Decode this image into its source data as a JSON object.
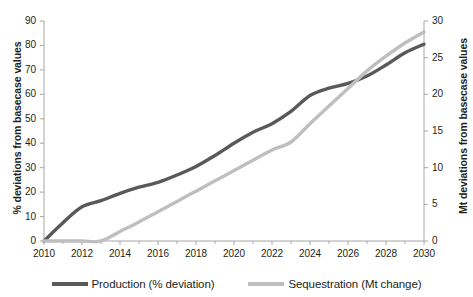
{
  "chart_data": {
    "type": "line",
    "title": "",
    "xlabel": "",
    "ylabel": "% deviations from basecase values",
    "ylabel_right": "Mt deviations from basecase values",
    "xlim": [
      2010,
      2030
    ],
    "ylim": [
      0,
      90
    ],
    "ylim_right": [
      0,
      30
    ],
    "xticks": [
      2010,
      2012,
      2014,
      2016,
      2018,
      2020,
      2022,
      2024,
      2026,
      2028,
      2030
    ],
    "xtick_labels": [
      "2010",
      "2012",
      "2014",
      "2016",
      "2018",
      "2020",
      "2022",
      "2024",
      "2026",
      "2028",
      "2030"
    ],
    "xminor_step": 1,
    "yticks": [
      0,
      10,
      20,
      30,
      40,
      50,
      60,
      70,
      80,
      90
    ],
    "ytick_labels": [
      "0",
      "10",
      "20",
      "30",
      "40",
      "50",
      "60",
      "70",
      "80",
      "90"
    ],
    "yticks_right": [
      0,
      5,
      10,
      15,
      20,
      25,
      30
    ],
    "ytick_labels_right": [
      "0",
      "5",
      "10",
      "15",
      "20",
      "25",
      "30"
    ],
    "grid": false,
    "legend_position": "bottom",
    "x": [
      2010,
      2011,
      2012,
      2013,
      2014,
      2015,
      2016,
      2017,
      2018,
      2019,
      2020,
      2021,
      2022,
      2023,
      2024,
      2025,
      2026,
      2027,
      2028,
      2029,
      2030
    ],
    "series": [
      {
        "name": "Production (% deviation)",
        "axis": "left",
        "color": "#595959",
        "values": [
          0,
          7.5,
          14.0,
          16.5,
          19.5,
          22.0,
          24.0,
          27.0,
          30.5,
          35.0,
          40.0,
          44.5,
          48.0,
          53.0,
          59.5,
          62.5,
          64.5,
          67.5,
          72.0,
          77.0,
          80.5
        ]
      },
      {
        "name": "Sequestration (Mt change)",
        "axis": "right",
        "color": "#bfbfbf",
        "values": [
          0,
          0,
          0,
          0,
          1.3,
          2.6,
          4.0,
          5.4,
          6.8,
          8.2,
          9.6,
          11.0,
          12.4,
          13.5,
          16.0,
          18.4,
          20.8,
          23.2,
          25.2,
          27.0,
          28.5
        ]
      }
    ],
    "legend": [
      {
        "label": "Production (% deviation)",
        "color": "#595959"
      },
      {
        "label": "Sequestration (Mt change)",
        "color": "#bfbfbf"
      }
    ]
  }
}
